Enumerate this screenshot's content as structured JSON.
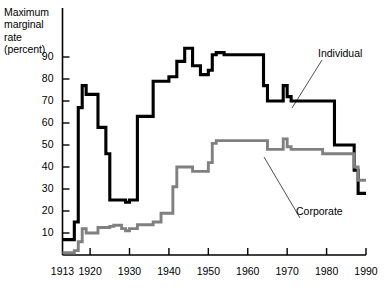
{
  "chart_data": {
    "type": "line",
    "title": "",
    "subtitle": "",
    "xlabel": "",
    "ylabel": "Maximum\nmarginal\nrate\n(percent)",
    "ylabel_lines": [
      "Maximum",
      "marginal",
      "rate",
      "(percent)"
    ],
    "xlim": [
      1913,
      1990
    ],
    "ylim": [
      0,
      95
    ],
    "grid": false,
    "legend_position": "inline-annotations",
    "y_ticks": [
      10,
      20,
      30,
      40,
      50,
      60,
      70,
      80,
      90
    ],
    "y_tick_labels": [
      "10",
      "20",
      "30",
      "40",
      "50",
      "60",
      "70",
      "80",
      "90"
    ],
    "x_ticks": [
      1913,
      1920,
      1930,
      1940,
      1950,
      1960,
      1970,
      1980,
      1990
    ],
    "x_tick_labels": [
      "1913",
      "1920",
      "1930",
      "1940",
      "1950",
      "1960",
      "1970",
      "1980",
      "1990"
    ],
    "series": [
      {
        "name": "Individual",
        "color": "#000000",
        "label": "Individual",
        "x": [
          1913,
          1915,
          1916,
          1917,
          1918,
          1919,
          1921,
          1922,
          1924,
          1925,
          1929,
          1930,
          1932,
          1936,
          1938,
          1940,
          1941,
          1942,
          1944,
          1946,
          1948,
          1950,
          1951,
          1952,
          1954,
          1964,
          1965,
          1968,
          1969,
          1970,
          1971,
          1981,
          1982,
          1987,
          1988,
          1990
        ],
        "values": [
          7,
          7,
          15,
          67,
          77,
          73,
          73,
          58,
          46,
          25,
          24,
          25,
          63,
          79,
          79,
          81,
          81,
          88,
          94,
          86,
          82,
          84,
          91,
          92,
          91,
          77,
          70,
          70,
          77,
          72,
          70,
          70,
          50,
          38.5,
          28,
          28
        ]
      },
      {
        "name": "Corporate",
        "color": "#808080",
        "label": "Corporate",
        "x": [
          1913,
          1916,
          1917,
          1918,
          1919,
          1922,
          1925,
          1926,
          1928,
          1929,
          1930,
          1932,
          1936,
          1938,
          1940,
          1941,
          1942,
          1946,
          1950,
          1951,
          1952,
          1964,
          1965,
          1968,
          1969,
          1970,
          1971,
          1979,
          1982,
          1987,
          1988,
          1990
        ],
        "values": [
          1,
          2,
          6,
          12,
          10,
          12.5,
          13,
          13.5,
          12,
          11,
          12,
          13.75,
          15,
          19,
          19,
          31,
          40,
          38,
          42,
          50.75,
          52,
          52,
          48,
          48,
          52.8,
          49.2,
          48,
          46,
          46,
          40,
          34,
          34
        ]
      }
    ],
    "annotations": [
      {
        "text": "Individual",
        "x_px": 318,
        "y_px": 47,
        "leader_to_x_px": 292,
        "leader_to_y_px": 108
      },
      {
        "text": "Corporate",
        "x_px": 296,
        "y_px": 205,
        "leader_to_x_px": 264,
        "leader_to_y_px": 157
      }
    ]
  }
}
